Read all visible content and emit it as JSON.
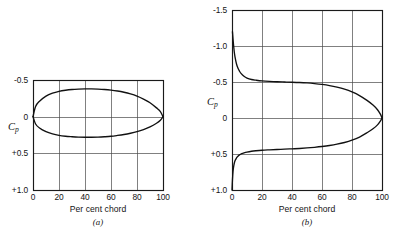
{
  "figure": {
    "background_color": "#ffffff",
    "ink_color": "#111111",
    "grid_color": "#4a4a4a"
  },
  "panels": [
    {
      "id": "a",
      "caption": "(a)",
      "y_axis_label": "C",
      "y_axis_label_sub": "p",
      "x_axis_label": "Per cent chord",
      "y_ticks": [
        "-0.5",
        "0",
        "+0.5",
        "+1.0"
      ],
      "x_ticks": [
        "0",
        "20",
        "40",
        "60",
        "80",
        "100"
      ]
    },
    {
      "id": "b",
      "caption": "(b)",
      "y_axis_label": "C",
      "y_axis_label_sub": "p",
      "x_axis_label": "Per cent chord",
      "y_ticks": [
        "-1.5",
        "-1.0",
        "-0.5",
        "0",
        "+0.5",
        "+1.0"
      ],
      "x_ticks": [
        "0",
        "20",
        "40",
        "60",
        "80",
        "100"
      ]
    }
  ],
  "chart_data": [
    {
      "type": "line",
      "panel": "a",
      "title": "",
      "subtitle": "(a)",
      "xlabel": "Per cent chord",
      "ylabel": "Cp",
      "xlim": [
        0,
        100
      ],
      "ylim": [
        -0.5,
        1.0
      ],
      "y_axis_inverted": true,
      "grid": true,
      "legend": "none",
      "xticks": [
        0,
        20,
        40,
        60,
        80,
        100
      ],
      "yticks": [
        -0.5,
        0,
        0.5,
        1.0
      ],
      "ytick_labels": [
        "-0.5",
        "0",
        "+0.5",
        "+1.0"
      ],
      "annotations": [
        "Symmetric closed pressure loop, upper and lower branches meet at x=0 and x=100 with Cp=0"
      ],
      "series": [
        {
          "name": "upper-surface",
          "x": [
            0,
            2,
            5,
            10,
            15,
            20,
            25,
            30,
            35,
            40,
            45,
            50,
            55,
            60,
            65,
            70,
            75,
            80,
            85,
            90,
            95,
            98,
            100
          ],
          "y": [
            0.0,
            -0.14,
            -0.21,
            -0.28,
            -0.32,
            -0.345,
            -0.36,
            -0.37,
            -0.375,
            -0.378,
            -0.378,
            -0.375,
            -0.37,
            -0.362,
            -0.35,
            -0.333,
            -0.31,
            -0.28,
            -0.24,
            -0.19,
            -0.12,
            -0.07,
            0.0
          ]
        },
        {
          "name": "lower-surface",
          "x": [
            0,
            2,
            5,
            10,
            15,
            20,
            25,
            30,
            35,
            40,
            45,
            50,
            55,
            60,
            65,
            70,
            75,
            80,
            85,
            90,
            95,
            98,
            100
          ],
          "y": [
            0.0,
            0.1,
            0.155,
            0.205,
            0.235,
            0.255,
            0.267,
            0.274,
            0.279,
            0.281,
            0.281,
            0.279,
            0.274,
            0.267,
            0.256,
            0.243,
            0.226,
            0.205,
            0.177,
            0.14,
            0.09,
            0.05,
            0.0
          ]
        }
      ]
    },
    {
      "type": "line",
      "panel": "b",
      "title": "",
      "subtitle": "(b)",
      "xlabel": "Per cent chord",
      "ylabel": "Cp",
      "xlim": [
        0,
        100
      ],
      "ylim": [
        -1.5,
        1.0
      ],
      "y_axis_inverted": true,
      "grid": true,
      "legend": "none",
      "xticks": [
        0,
        20,
        40,
        60,
        80,
        100
      ],
      "yticks": [
        -1.5,
        -1.0,
        -0.5,
        0,
        0.5,
        1.0
      ],
      "ytick_labels": [
        "-1.5",
        "-1.0",
        "-0.5",
        "0",
        "+0.5",
        "+1.0"
      ],
      "annotations": [
        "Upper surface suction peak Cp about -1.2 near leading edge",
        "Lower surface starts at stagnation Cp = +1.0 at x = 0",
        "Both branches close at trailing edge x = 100, Cp = 0"
      ],
      "series": [
        {
          "name": "upper-surface",
          "x": [
            0.3,
            0.6,
            1,
            1.5,
            2,
            3,
            4,
            5,
            6,
            8,
            10,
            13,
            16,
            20,
            25,
            30,
            35,
            40,
            45,
            50,
            55,
            60,
            65,
            70,
            75,
            80,
            85,
            90,
            94,
            97,
            99,
            100
          ],
          "y": [
            -1.2,
            -1.12,
            -1.02,
            -0.92,
            -0.85,
            -0.75,
            -0.69,
            -0.65,
            -0.62,
            -0.58,
            -0.555,
            -0.535,
            -0.525,
            -0.515,
            -0.508,
            -0.503,
            -0.5,
            -0.497,
            -0.493,
            -0.487,
            -0.478,
            -0.466,
            -0.45,
            -0.428,
            -0.4,
            -0.362,
            -0.312,
            -0.245,
            -0.18,
            -0.115,
            -0.05,
            0.0
          ]
        },
        {
          "name": "lower-surface",
          "x": [
            0,
            0.3,
            0.7,
            1.2,
            2,
            3,
            4,
            5,
            6.5,
            8,
            10,
            13,
            16,
            20,
            25,
            30,
            35,
            40,
            45,
            50,
            55,
            60,
            65,
            70,
            75,
            80,
            85,
            90,
            94,
            97,
            99,
            100
          ],
          "y": [
            1.0,
            0.86,
            0.74,
            0.66,
            0.595,
            0.555,
            0.53,
            0.512,
            0.495,
            0.484,
            0.473,
            0.462,
            0.455,
            0.448,
            0.442,
            0.437,
            0.433,
            0.428,
            0.423,
            0.416,
            0.407,
            0.396,
            0.382,
            0.364,
            0.34,
            0.308,
            0.265,
            0.205,
            0.15,
            0.095,
            0.04,
            0.0
          ]
        }
      ]
    }
  ]
}
